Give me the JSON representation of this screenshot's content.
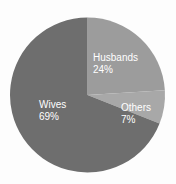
{
  "chart_data": {
    "type": "pie",
    "title": "",
    "subtitle": "",
    "xlabel": "",
    "ylabel": "",
    "legend_position": "none",
    "grid": false,
    "start_angle_deg": 0,
    "direction": "clockwise",
    "categories": [
      "Husbands",
      "Others",
      "Wives"
    ],
    "values": [
      24,
      7,
      69
    ],
    "unit": "%",
    "slices": [
      {
        "label": "Husbands",
        "value": 24,
        "pct_text": "24%",
        "color": "#9c9c9c",
        "start_deg": 0,
        "end_deg": 86.4
      },
      {
        "label": "Others",
        "value": 7,
        "pct_text": "7%",
        "color": "#a8a8a8",
        "start_deg": 86.4,
        "end_deg": 111.6
      },
      {
        "label": "Wives",
        "value": 69,
        "pct_text": "69%",
        "color": "#6e6e6e",
        "start_deg": 111.6,
        "end_deg": 360
      }
    ]
  },
  "labels": {
    "husbands": {
      "name": "Husbands",
      "pct": "24%"
    },
    "others": {
      "name": "Others",
      "pct": "7%"
    },
    "wives": {
      "name": "Wives",
      "pct": "69%"
    }
  },
  "colors": {
    "background": "#fdfdfd",
    "label_text": "#ffffff",
    "wives_slice": "#6e6e6e",
    "husbands_slice": "#9c9c9c",
    "others_slice": "#a8a8a8"
  }
}
